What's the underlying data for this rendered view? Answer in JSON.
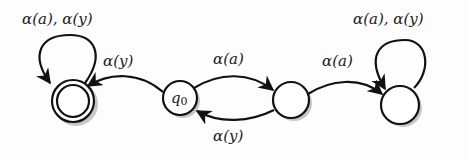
{
  "diagram": {
    "type": "finite-automaton",
    "states": [
      {
        "id": "s_accept",
        "label": "",
        "accepting": true,
        "cx": 73,
        "cy": 101,
        "r": 21
      },
      {
        "id": "q0",
        "label": "q0",
        "initial": true,
        "cx": 180,
        "cy": 98,
        "r": 17
      },
      {
        "id": "s_mid",
        "label": "",
        "cx": 291,
        "cy": 100,
        "r": 18
      },
      {
        "id": "s_right",
        "label": "",
        "cx": 400,
        "cy": 105,
        "r": 19
      }
    ],
    "transitions": [
      {
        "from": "s_accept",
        "to": "s_accept",
        "label": "α(a), α(y)"
      },
      {
        "from": "q0",
        "to": "s_accept",
        "label": "α(y)"
      },
      {
        "from": "q0",
        "to": "s_mid",
        "label": "α(a)"
      },
      {
        "from": "s_mid",
        "to": "q0",
        "label": "α(y)"
      },
      {
        "from": "s_mid",
        "to": "s_right",
        "label": "α(a)"
      },
      {
        "from": "s_right",
        "to": "s_right",
        "label": "α(a), α(y)"
      }
    ],
    "labels": {
      "loop_accept": "α(a), α(y)",
      "q0_to_accept": "α(y)",
      "q0_to_mid": "α(a)",
      "mid_to_q0": "α(y)",
      "mid_to_right": "α(a)",
      "loop_right": "α(a), α(y)",
      "q0_name": "q",
      "q0_sub": "0"
    }
  }
}
